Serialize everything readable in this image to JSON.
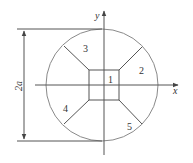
{
  "diagram": {
    "axes": {
      "x_label": "x",
      "y_label": "y"
    },
    "dimension": {
      "label": "2a"
    },
    "regions": [
      {
        "id": "1",
        "label": "1"
      },
      {
        "id": "2",
        "label": "2"
      },
      {
        "id": "3",
        "label": "3"
      },
      {
        "id": "4",
        "label": "4"
      },
      {
        "id": "5",
        "label": "5"
      }
    ],
    "colors": {
      "line": "#555555",
      "circle": "#8a8a8a",
      "background": "#ffffff"
    }
  }
}
